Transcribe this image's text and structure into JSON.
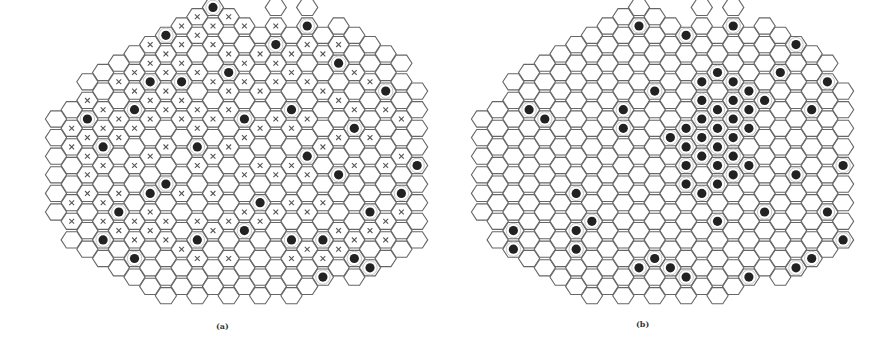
{
  "figure": {
    "geometry": {
      "col_step": 15.7,
      "row_step": 18.6,
      "hex_radius": 10.6,
      "stroke_color": "#666666",
      "stroke_width": 1.1,
      "dot_color": "#222222",
      "dot_radius": 4.6,
      "dot_ring_radius": 7.2,
      "cross_color": "#555555",
      "cross_size": 2.4,
      "columns": 24,
      "column_rows": [
        [
          6,
          11
        ],
        [
          5,
          12
        ],
        [
          4,
          13
        ],
        [
          3,
          13
        ],
        [
          3,
          14
        ],
        [
          2,
          14
        ],
        [
          2,
          15
        ],
        [
          1,
          15
        ],
        [
          1,
          15
        ],
        [
          0,
          15
        ],
        [
          0,
          15
        ],
        [
          0,
          15
        ],
        [
          1,
          15
        ],
        [
          1,
          15
        ],
        [
          0,
          15
        ],
        [
          1,
          15
        ],
        [
          0,
          15
        ],
        [
          1,
          14
        ],
        [
          1,
          14
        ],
        [
          1,
          14
        ],
        [
          2,
          14
        ],
        [
          2,
          13
        ],
        [
          3,
          13
        ],
        [
          4,
          12
        ]
      ]
    },
    "panels": [
      {
        "id": "a",
        "caption": "(a)",
        "origin_x": 56,
        "origin_y": 26,
        "dots": [
          [
            2,
            6
          ],
          [
            3,
            7
          ],
          [
            5,
            5
          ],
          [
            6,
            4
          ],
          [
            7,
            1
          ],
          [
            7,
            9
          ],
          [
            5,
            13
          ],
          [
            4,
            11
          ],
          [
            3,
            12
          ],
          [
            8,
            4
          ],
          [
            10,
            0
          ],
          [
            9,
            7
          ],
          [
            11,
            3
          ],
          [
            12,
            6
          ],
          [
            13,
            10
          ],
          [
            14,
            2
          ],
          [
            15,
            5
          ],
          [
            16,
            1
          ],
          [
            16,
            8
          ],
          [
            17,
            12
          ],
          [
            18,
            3
          ],
          [
            18,
            9
          ],
          [
            19,
            6
          ],
          [
            20,
            11
          ],
          [
            21,
            4
          ],
          [
            22,
            10
          ],
          [
            6,
            10
          ],
          [
            9,
            12
          ],
          [
            12,
            12
          ],
          [
            15,
            12
          ],
          [
            17,
            14
          ],
          [
            19,
            13
          ],
          [
            20,
            14
          ],
          [
            23,
            8
          ]
        ],
        "crosses": [
          [
            1,
            6
          ],
          [
            1,
            7
          ],
          [
            2,
            5
          ],
          [
            2,
            7
          ],
          [
            2,
            8
          ],
          [
            3,
            5
          ],
          [
            3,
            6
          ],
          [
            3,
            8
          ],
          [
            4,
            4
          ],
          [
            4,
            6
          ],
          [
            4,
            7
          ],
          [
            5,
            3
          ],
          [
            5,
            4
          ],
          [
            5,
            6
          ],
          [
            5,
            8
          ],
          [
            6,
            2
          ],
          [
            6,
            3
          ],
          [
            6,
            5
          ],
          [
            6,
            6
          ],
          [
            6,
            8
          ],
          [
            7,
            2
          ],
          [
            7,
            3
          ],
          [
            7,
            4
          ],
          [
            7,
            5
          ],
          [
            7,
            7
          ],
          [
            8,
            1
          ],
          [
            8,
            2
          ],
          [
            8,
            3
          ],
          [
            8,
            5
          ],
          [
            8,
            6
          ],
          [
            9,
            0
          ],
          [
            9,
            1
          ],
          [
            9,
            3
          ],
          [
            9,
            5
          ],
          [
            9,
            6
          ],
          [
            9,
            8
          ],
          [
            10,
            1
          ],
          [
            10,
            2
          ],
          [
            10,
            4
          ],
          [
            10,
            6
          ],
          [
            10,
            8
          ],
          [
            11,
            0
          ],
          [
            11,
            2
          ],
          [
            11,
            4
          ],
          [
            11,
            5
          ],
          [
            11,
            7
          ],
          [
            12,
            1
          ],
          [
            12,
            3
          ],
          [
            12,
            4
          ],
          [
            12,
            7
          ],
          [
            12,
            9
          ],
          [
            13,
            2
          ],
          [
            13,
            4
          ],
          [
            13,
            6
          ],
          [
            13,
            8
          ],
          [
            14,
            1
          ],
          [
            14,
            3
          ],
          [
            14,
            4
          ],
          [
            14,
            6
          ],
          [
            14,
            9
          ],
          [
            15,
            2
          ],
          [
            15,
            3
          ],
          [
            15,
            6
          ],
          [
            15,
            8
          ],
          [
            16,
            2
          ],
          [
            16,
            4
          ],
          [
            16,
            6
          ],
          [
            16,
            9
          ],
          [
            17,
            2
          ],
          [
            17,
            4
          ],
          [
            17,
            7
          ],
          [
            17,
            10
          ],
          [
            18,
            2
          ],
          [
            18,
            5
          ],
          [
            18,
            7
          ],
          [
            19,
            3
          ],
          [
            19,
            5
          ],
          [
            19,
            8
          ],
          [
            20,
            4
          ],
          [
            20,
            7
          ],
          [
            21,
            5
          ],
          [
            21,
            8
          ],
          [
            22,
            6
          ],
          [
            22,
            8
          ],
          [
            3,
            10
          ],
          [
            4,
            10
          ],
          [
            4,
            12
          ],
          [
            5,
            11
          ],
          [
            5,
            12
          ],
          [
            6,
            11
          ],
          [
            6,
            12
          ],
          [
            7,
            11
          ],
          [
            7,
            12
          ],
          [
            8,
            10
          ],
          [
            8,
            13
          ],
          [
            9,
            11
          ],
          [
            9,
            13
          ],
          [
            10,
            10
          ],
          [
            10,
            12
          ],
          [
            11,
            11
          ],
          [
            11,
            13
          ],
          [
            12,
            11
          ],
          [
            13,
            11
          ],
          [
            14,
            11
          ],
          [
            15,
            10
          ],
          [
            15,
            13
          ],
          [
            16,
            11
          ],
          [
            16,
            13
          ],
          [
            17,
            13
          ],
          [
            18,
            12
          ],
          [
            18,
            13
          ],
          [
            19,
            12
          ],
          [
            20,
            12
          ],
          [
            21,
            11
          ],
          [
            21,
            12
          ],
          [
            22,
            11
          ],
          [
            2,
            9
          ],
          [
            2,
            10
          ],
          [
            3,
            11
          ],
          [
            1,
            10
          ],
          [
            1,
            11
          ]
        ]
      },
      {
        "id": "b",
        "caption": "(b)",
        "origin_x": 482,
        "origin_y": 26,
        "dots": [
          [
            3,
            5
          ],
          [
            4,
            6
          ],
          [
            6,
            10
          ],
          [
            7,
            11
          ],
          [
            6,
            12
          ],
          [
            6,
            13
          ],
          [
            2,
            12
          ],
          [
            2,
            13
          ],
          [
            3,
            14
          ],
          [
            9,
            5
          ],
          [
            9,
            6
          ],
          [
            11,
            4
          ],
          [
            10,
            14
          ],
          [
            11,
            13
          ],
          [
            12,
            7
          ],
          [
            13,
            6
          ],
          [
            13,
            7
          ],
          [
            13,
            8
          ],
          [
            13,
            9
          ],
          [
            14,
            4
          ],
          [
            14,
            5
          ],
          [
            14,
            6
          ],
          [
            14,
            7
          ],
          [
            14,
            8
          ],
          [
            15,
            3
          ],
          [
            15,
            5
          ],
          [
            15,
            6
          ],
          [
            15,
            7
          ],
          [
            15,
            8
          ],
          [
            15,
            9
          ],
          [
            15,
            11
          ],
          [
            16,
            4
          ],
          [
            16,
            5
          ],
          [
            16,
            6
          ],
          [
            16,
            7
          ],
          [
            16,
            8
          ],
          [
            16,
            9
          ],
          [
            17,
            4
          ],
          [
            17,
            5
          ],
          [
            17,
            6
          ],
          [
            17,
            8
          ],
          [
            18,
            5
          ],
          [
            14,
            10
          ],
          [
            10,
            1
          ],
          [
            13,
            1
          ],
          [
            16,
            1
          ],
          [
            19,
            3
          ],
          [
            20,
            2
          ],
          [
            18,
            11
          ],
          [
            20,
            9
          ],
          [
            22,
            11
          ],
          [
            21,
            13
          ],
          [
            22,
            14
          ],
          [
            23,
            8
          ],
          [
            17,
            14
          ],
          [
            19,
            15
          ],
          [
            20,
            14
          ],
          [
            13,
            14
          ],
          [
            12,
            14
          ],
          [
            21,
            5
          ],
          [
            22,
            4
          ],
          [
            23,
            12
          ]
        ],
        "crosses": []
      }
    ]
  }
}
